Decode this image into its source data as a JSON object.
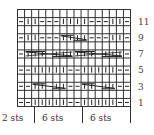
{
  "chart": {
    "columns": 16,
    "rows": 12,
    "grid_color": "#333333",
    "symbol_color": "#222222",
    "legend_symbols": {
      "-": "purl",
      "|": "knit",
      "C": "cable cross"
    },
    "pattern_rows": [
      {
        "row": 1,
        "cells": [
          "-",
          "-",
          "|",
          "|",
          "|",
          "|",
          "|",
          "-",
          "-",
          "|",
          "|",
          "|",
          "|",
          "|",
          "-",
          "-"
        ]
      },
      {
        "row": 2,
        "cells": [
          "",
          "",
          "",
          "",
          "",
          "",
          "",
          "",
          "",
          "",
          "",
          "",
          "",
          "",
          "",
          ""
        ]
      },
      {
        "row": 3,
        "cells": [
          "-",
          "-",
          "C5",
          "",
          "",
          "",
          "",
          "-",
          "-",
          "C5",
          "",
          "",
          "",
          "",
          "-",
          "-"
        ]
      },
      {
        "row": 4,
        "cells": [
          "",
          "",
          "",
          "",
          "",
          "",
          "",
          "",
          "",
          "",
          "",
          "",
          "",
          "",
          "",
          ""
        ]
      },
      {
        "row": 5,
        "cells": [
          "-",
          "-",
          "|",
          "|",
          "|",
          "|",
          "|",
          "-",
          "-",
          "|",
          "|",
          "|",
          "|",
          "|",
          "-",
          "-"
        ]
      },
      {
        "row": 6,
        "cells": [
          "",
          "",
          "",
          "",
          "",
          "",
          "",
          "",
          "",
          "",
          "",
          "",
          "",
          "",
          "",
          ""
        ]
      },
      {
        "row": 7,
        "cells": [
          "-",
          "C7",
          "",
          "",
          "",
          "",
          "",
          "",
          "C7",
          "",
          "",
          "",
          "",
          "",
          "",
          "-"
        ]
      },
      {
        "row": 8,
        "cells": [
          "",
          "",
          "",
          "",
          "",
          "",
          "",
          "",
          "",
          "",
          "",
          "",
          "",
          "",
          "",
          ""
        ]
      },
      {
        "row": 9,
        "cells": [
          "-",
          "|",
          "|",
          "-",
          "-",
          "-",
          "C4",
          "",
          "",
          "",
          "-",
          "-",
          "-",
          "|",
          "|",
          "-"
        ]
      },
      {
        "row": 10,
        "cells": [
          "",
          "",
          "",
          "",
          "",
          "",
          "",
          "",
          "",
          "",
          "",
          "",
          "",
          "",
          "",
          ""
        ]
      },
      {
        "row": 11,
        "cells": [
          "-",
          "|",
          "|",
          "-",
          "-",
          "-",
          "|",
          "|",
          "|",
          "|",
          "-",
          "-",
          "-",
          "|",
          "|",
          "-"
        ]
      },
      {
        "row": 12,
        "cells": [
          "",
          "",
          "",
          "",
          "",
          "",
          "",
          "",
          "",
          "",
          "",
          "",
          "",
          "",
          "",
          ""
        ]
      }
    ]
  },
  "row_numbers": [
    "11",
    "9",
    "7",
    "5",
    "3",
    "1"
  ],
  "stitch_labels": [
    "2 sts",
    "6 sts",
    "6 sts"
  ]
}
